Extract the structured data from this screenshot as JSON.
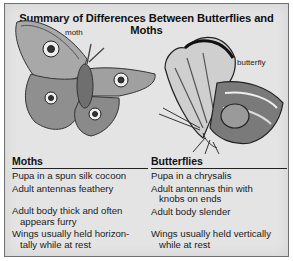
{
  "title": "Summary of Differences Between Butterflies and Moths",
  "illustrations": {
    "moth_label": "moth",
    "butterfly_label": "butterfly"
  },
  "moths": {
    "heading": "Moths",
    "items": [
      {
        "line1": "Pupa in a spun silk cocoon",
        "line2": ""
      },
      {
        "line1": "Adult antennas feathery",
        "line2": ""
      },
      {
        "line1": "Adult body thick and often",
        "line2": "appears furry"
      },
      {
        "line1": "Wings usually held horizon-",
        "line2": "tally while at rest"
      }
    ]
  },
  "butterflies": {
    "heading": "Butterflies",
    "items": [
      {
        "line1": "Pupa in a chrysalis",
        "line2": ""
      },
      {
        "line1": "Adult antennas thin with",
        "line2": "knobs on ends"
      },
      {
        "line1": "Adult body slender",
        "line2": ""
      },
      {
        "line1": "Wings usually held vertically",
        "line2": "while at rest"
      }
    ]
  }
}
